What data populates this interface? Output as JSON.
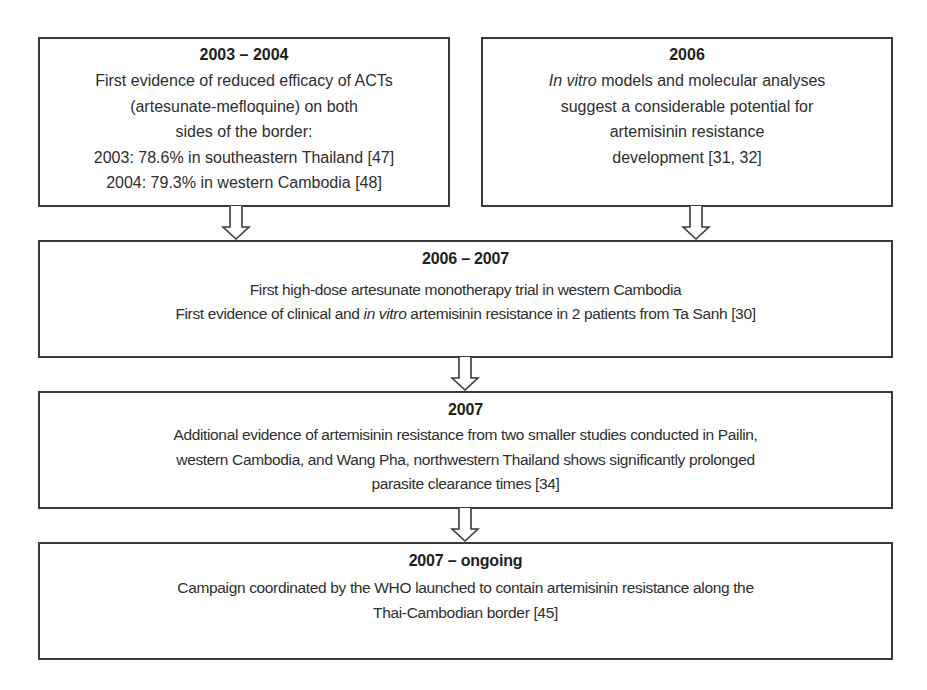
{
  "colors": {
    "border": "#3a3a3a",
    "text": "#2e2e2e",
    "background": "#ffffff"
  },
  "boxes": [
    {
      "id": "box-2003-2004",
      "title": "2003 – 2004",
      "lines": [
        "First evidence of reduced efficacy of ACTs",
        "(artesunate-mefloquine) on both",
        "sides of the border:",
        "2003: 78.6% in southeastern Thailand [47]",
        "2004: 79.3% in western Cambodia [48]"
      ]
    },
    {
      "id": "box-2006",
      "title": "2006",
      "lines": [
        {
          "italic": "In vitro",
          "rest": " models and molecular analyses"
        },
        "suggest a considerable potential for",
        "artemisinin resistance",
        "development [31, 32]"
      ]
    },
    {
      "id": "box-2006-2007",
      "title": "2006 – 2007",
      "lines": [
        "First high-dose artesunate monotherapy trial in western Cambodia",
        {
          "pre": "First evidence of clinical and ",
          "italic": "in vitro",
          "rest": " artemisinin resistance in 2 patients from Ta Sanh [30]"
        }
      ]
    },
    {
      "id": "box-2007",
      "title": "2007",
      "lines": [
        "Additional evidence of artemisinin resistance from two smaller studies conducted in Pailin,",
        "western Cambodia, and Wang Pha, northwestern Thailand shows significantly prolonged",
        "parasite clearance times [34]"
      ]
    },
    {
      "id": "box-2007-ongoing",
      "title": "2007 – ongoing",
      "lines": [
        "Campaign coordinated by the WHO launched to contain artemisinin resistance along the",
        "Thai-Cambodian border [45]"
      ]
    }
  ],
  "arrows": [
    {
      "from": "box-2003-2004",
      "to": "box-2006-2007",
      "icon": "down-arrow-icon"
    },
    {
      "from": "box-2006",
      "to": "box-2006-2007",
      "icon": "down-arrow-icon"
    },
    {
      "from": "box-2006-2007",
      "to": "box-2007",
      "icon": "down-arrow-icon"
    },
    {
      "from": "box-2007",
      "to": "box-2007-ongoing",
      "icon": "down-arrow-icon"
    }
  ]
}
